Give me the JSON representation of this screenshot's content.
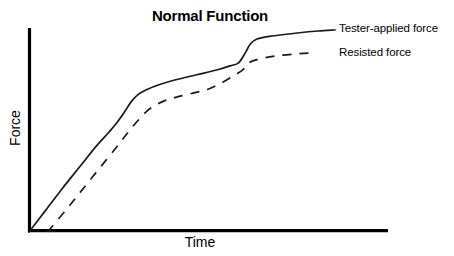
{
  "chart_data": {
    "type": "line",
    "title": "Normal Function",
    "xlabel": "Time",
    "ylabel": "Force",
    "grid": false,
    "legend_position": "right-inline",
    "axis": {
      "x_ticks": [],
      "y_ticks": [],
      "x_range_label": "Time (unlabeled, increasing left to right)",
      "y_range_label": "Force (unlabeled, increasing bottom to top)"
    },
    "series": [
      {
        "name": "Tester-applied force",
        "style": "solid",
        "color": "#1a1a1a",
        "points": [
          [
            0,
            0
          ],
          [
            20,
            22
          ],
          [
            40,
            44
          ],
          [
            60,
            65
          ],
          [
            80,
            86
          ],
          [
            95,
            100
          ],
          [
            105,
            110
          ],
          [
            115,
            122
          ],
          [
            122,
            131
          ],
          [
            130,
            138
          ],
          [
            140,
            143
          ],
          [
            155,
            148
          ],
          [
            175,
            153
          ],
          [
            200,
            158
          ],
          [
            225,
            163
          ],
          [
            240,
            167
          ],
          [
            250,
            170
          ],
          [
            258,
            180
          ],
          [
            264,
            189
          ],
          [
            272,
            194
          ],
          [
            290,
            197
          ],
          [
            320,
            200
          ],
          [
            345,
            202
          ],
          [
            365,
            203
          ]
        ]
      },
      {
        "name": "Resisted force",
        "style": "dashed",
        "color": "#1a1a1a",
        "dash_pattern": [
          9,
          8
        ],
        "points": [
          [
            22,
            0
          ],
          [
            45,
            23
          ],
          [
            65,
            44
          ],
          [
            85,
            65
          ],
          [
            105,
            86
          ],
          [
            118,
            100
          ],
          [
            130,
            112
          ],
          [
            140,
            121
          ],
          [
            150,
            127
          ],
          [
            162,
            132
          ],
          [
            178,
            136
          ],
          [
            198,
            140
          ],
          [
            215,
            144
          ],
          [
            230,
            150
          ],
          [
            244,
            157
          ],
          [
            255,
            163
          ],
          [
            262,
            170
          ],
          [
            275,
            174
          ],
          [
            295,
            177
          ],
          [
            320,
            179
          ],
          [
            340,
            180
          ]
        ]
      }
    ]
  },
  "figure": {
    "title": "Normal Function",
    "y_axis_label": "Force",
    "x_axis_label": "Time",
    "legend": {
      "solid_series_label": "Tester-applied force",
      "dashed_series_label": "Resisted force"
    },
    "colors": {
      "line": "#1a1a1a",
      "axis": "#000000",
      "background": "#ffffff",
      "text": "#000000"
    }
  }
}
